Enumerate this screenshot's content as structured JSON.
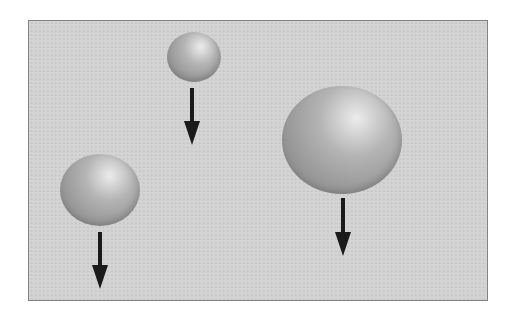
{
  "diagram": {
    "colors": {
      "page_background": "#ffffff",
      "panel_background": "#d2d2d2",
      "panel_border": "#828282",
      "sphere_highlight": "#ececec",
      "sphere_mid": "#b4b4b4",
      "sphere_shadow": "#7c7c7c",
      "arrow": "#1a1a1a"
    },
    "panel": {
      "x": 28,
      "y": 20,
      "width": 460,
      "height": 281
    },
    "objects": [
      {
        "id": "small-sphere",
        "label": "small sphere",
        "cx": 194,
        "cy": 57,
        "rx": 27,
        "ry": 25,
        "arrow": {
          "x": 192,
          "y1": 88,
          "y2": 145,
          "direction": "down"
        }
      },
      {
        "id": "medium-sphere",
        "label": "medium sphere",
        "cx": 100,
        "cy": 190,
        "rx": 40,
        "ry": 36,
        "arrow": {
          "x": 100,
          "y1": 232,
          "y2": 289,
          "direction": "down"
        }
      },
      {
        "id": "large-sphere",
        "label": "large sphere",
        "cx": 342,
        "cy": 140,
        "rx": 60,
        "ry": 54,
        "arrow": {
          "x": 343,
          "y1": 198,
          "y2": 256,
          "direction": "down"
        }
      }
    ]
  }
}
